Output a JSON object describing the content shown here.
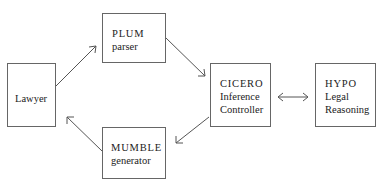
{
  "diagram": {
    "type": "flow",
    "nodes": [
      {
        "id": "lawyer",
        "lines": [
          "Lawyer"
        ]
      },
      {
        "id": "plum",
        "lines": [
          "PLUM",
          "parser"
        ]
      },
      {
        "id": "cicero",
        "lines": [
          "CICERO",
          "Inference",
          "Controller"
        ]
      },
      {
        "id": "hypo",
        "lines": [
          "HYPO",
          "Legal",
          "Reasoning"
        ]
      },
      {
        "id": "mumble",
        "lines": [
          "MUMBLE",
          "generator"
        ]
      }
    ],
    "edges": [
      {
        "from": "lawyer",
        "to": "plum",
        "direction": "forward"
      },
      {
        "from": "plum",
        "to": "cicero",
        "direction": "forward"
      },
      {
        "from": "cicero",
        "to": "hypo",
        "direction": "bidirectional"
      },
      {
        "from": "cicero",
        "to": "mumble",
        "direction": "forward"
      },
      {
        "from": "mumble",
        "to": "lawyer",
        "direction": "forward"
      }
    ],
    "colors": {
      "line": "#555555",
      "box_border": "#666666",
      "text": "#222222"
    }
  }
}
